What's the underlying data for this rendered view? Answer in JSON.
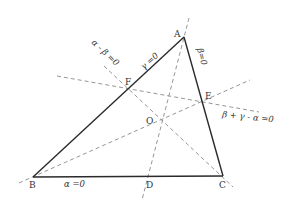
{
  "diagram": {
    "type": "geometry-triangle",
    "points": {
      "A": {
        "label": "A",
        "x": 184,
        "y": 37
      },
      "B": {
        "label": "B",
        "x": 33,
        "y": 177
      },
      "C": {
        "label": "C",
        "x": 223,
        "y": 176
      },
      "D": {
        "label": "D",
        "x": 147,
        "y": 177
      },
      "E": {
        "label": "E",
        "x": 203,
        "y": 101
      },
      "F": {
        "label": "F",
        "x": 128,
        "y": 89
      },
      "O": {
        "label": "O",
        "x": 162,
        "y": 118
      }
    },
    "labels": {
      "side_BC": "α =0",
      "side_AB": "γ =0",
      "side_AC": "β=0",
      "line_CF": "α - β =0",
      "line_EF": "β + γ - α =0"
    },
    "colors": {
      "sides": "#2a2a2a",
      "dashed": "#8a8a8a",
      "text": "#333333"
    }
  }
}
